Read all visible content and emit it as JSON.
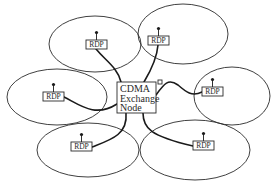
{
  "diagram": {
    "title": "",
    "center_node": {
      "lines": [
        "CDMA",
        "Exchange",
        "Node"
      ],
      "x": 117,
      "y": 82,
      "w": 39,
      "h": 31
    },
    "small_marker": {
      "label": "",
      "x": 158,
      "y": 80,
      "w": 4,
      "h": 4
    },
    "cells": [
      {
        "id": "cell-top-left",
        "cx": 95,
        "cy": 44,
        "rx": 46,
        "ry": 28
      },
      {
        "id": "cell-top-right",
        "cx": 183,
        "cy": 34,
        "rx": 45,
        "ry": 30
      },
      {
        "id": "cell-left",
        "cx": 57,
        "cy": 97,
        "rx": 50,
        "ry": 28
      },
      {
        "id": "cell-right",
        "cx": 232,
        "cy": 96,
        "rx": 38,
        "ry": 29
      },
      {
        "id": "cell-bottom-left",
        "cx": 88,
        "cy": 150,
        "rx": 51,
        "ry": 27
      },
      {
        "id": "cell-bottom-right",
        "cx": 195,
        "cy": 150,
        "rx": 55,
        "ry": 30
      }
    ],
    "rdps": [
      {
        "label": "RDP",
        "x": 86,
        "y": 40,
        "w": 21,
        "h": 9
      },
      {
        "label": "RDP",
        "x": 148,
        "y": 36,
        "w": 21,
        "h": 9
      },
      {
        "label": "RDP",
        "x": 43,
        "y": 92,
        "w": 21,
        "h": 9
      },
      {
        "label": "RDP",
        "x": 202,
        "y": 87,
        "w": 21,
        "h": 9
      },
      {
        "label": "RDP",
        "x": 71,
        "y": 142,
        "w": 21,
        "h": 9
      },
      {
        "label": "RDP",
        "x": 193,
        "y": 141,
        "w": 21,
        "h": 9
      }
    ],
    "links": [
      "M 96 49 C 105 60, 118 68, 121 82",
      "M 158 45 C 157 58, 150 72, 144 82",
      "M 64 97 C 80 105, 95 118, 117 104",
      "M 156 95 C 164 84, 168 78, 178 85 C 186 92, 192 97, 202 92",
      "M 92 147 C 110 140, 128 135, 126 113",
      "M 143 113 C 143 128, 150 136, 193 146"
    ],
    "stroke_color": "#1a1a1a",
    "background": "#ffffff"
  }
}
